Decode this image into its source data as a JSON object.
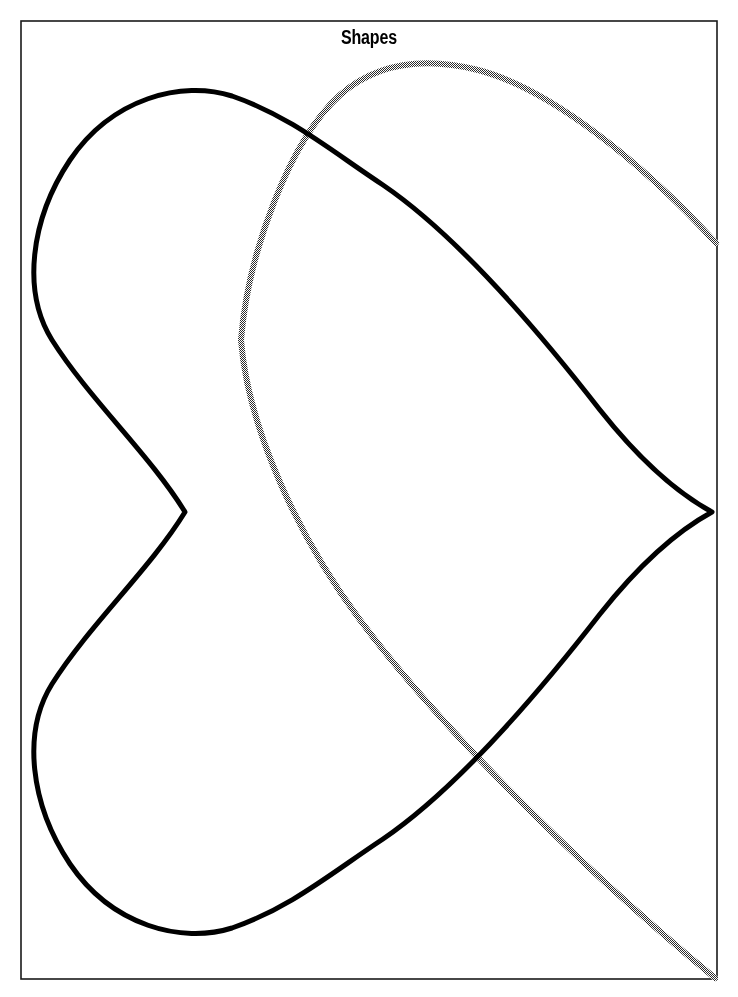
{
  "page": {
    "width": 738,
    "height": 997,
    "background_color": "#ffffff"
  },
  "title": {
    "text": "Shapes",
    "color": "#000000",
    "x": 366,
    "y": 40
  },
  "frame": {
    "name": "page-border",
    "x": 21,
    "y": 21,
    "width": 696,
    "height": 958,
    "stroke_color": "#1a1a1a",
    "stroke_width": 1.6,
    "fill": "none"
  },
  "chart_data": {
    "type": "line",
    "title": "Shapes",
    "xlabel": "",
    "ylabel": "",
    "xlim": [
      0,
      738
    ],
    "ylim": [
      0,
      997
    ],
    "grid": false,
    "legend": null,
    "axes_visible": false,
    "series": [
      {
        "name": "black-heart-outline",
        "stroke_color": "#000000",
        "stroke_width": 5,
        "fill": "none",
        "closed": true,
        "style": "solid",
        "key_points": {
          "left_cusp": [
            185,
            512
          ],
          "right_cusp": [
            712,
            512
          ],
          "top_apex": [
            215,
            94
          ],
          "bottom_apex": [
            222,
            922
          ],
          "leftmost_upper": [
            39,
            280
          ],
          "leftmost_lower": [
            39,
            755
          ]
        },
        "path": "M 185 512 C 150 455 90 400 52 340 C 22 292 30 220 70 160 C 112 98 182 80 232 96 C 290 116 330 150 383 185 C 452 232 530 320 600 410 C 650 473 690 500 712 512 C 690 524 650 551 600 614 C 530 704 452 792 383 839 C 330 874 290 908 232 928 C 182 944 112 926 70 864 C 30 804 22 732 52 684 C 90 624 150 569 185 512 Z"
      },
      {
        "name": "gray-dithered-curve",
        "stroke_color": "#8c8c8c",
        "stroke_width": 6,
        "fill": "none",
        "closed": false,
        "style": "dithered",
        "key_points": {
          "top_apex": [
            435,
            63
          ],
          "leftmost": [
            241,
            340
          ],
          "right_edge_exit": [
            716,
            243
          ],
          "crossing_with_black_upper": [
            305,
            120
          ],
          "crossing_with_black_lower": [
            500,
            688
          ],
          "bottom_right_exit": [
            715,
            978
          ]
        },
        "path_upper": "M 241 340 C 248 252 290 140 340 95 C 380 60 430 58 478 70 C 548 88 640 160 716 243",
        "path_lower": "M 241 340 C 248 430 300 540 360 620 C 430 714 560 850 715 978"
      }
    ]
  },
  "colors": {
    "black": "#000000",
    "gray": "#8c8c8c",
    "border": "#1a1a1a",
    "background": "#ffffff"
  }
}
